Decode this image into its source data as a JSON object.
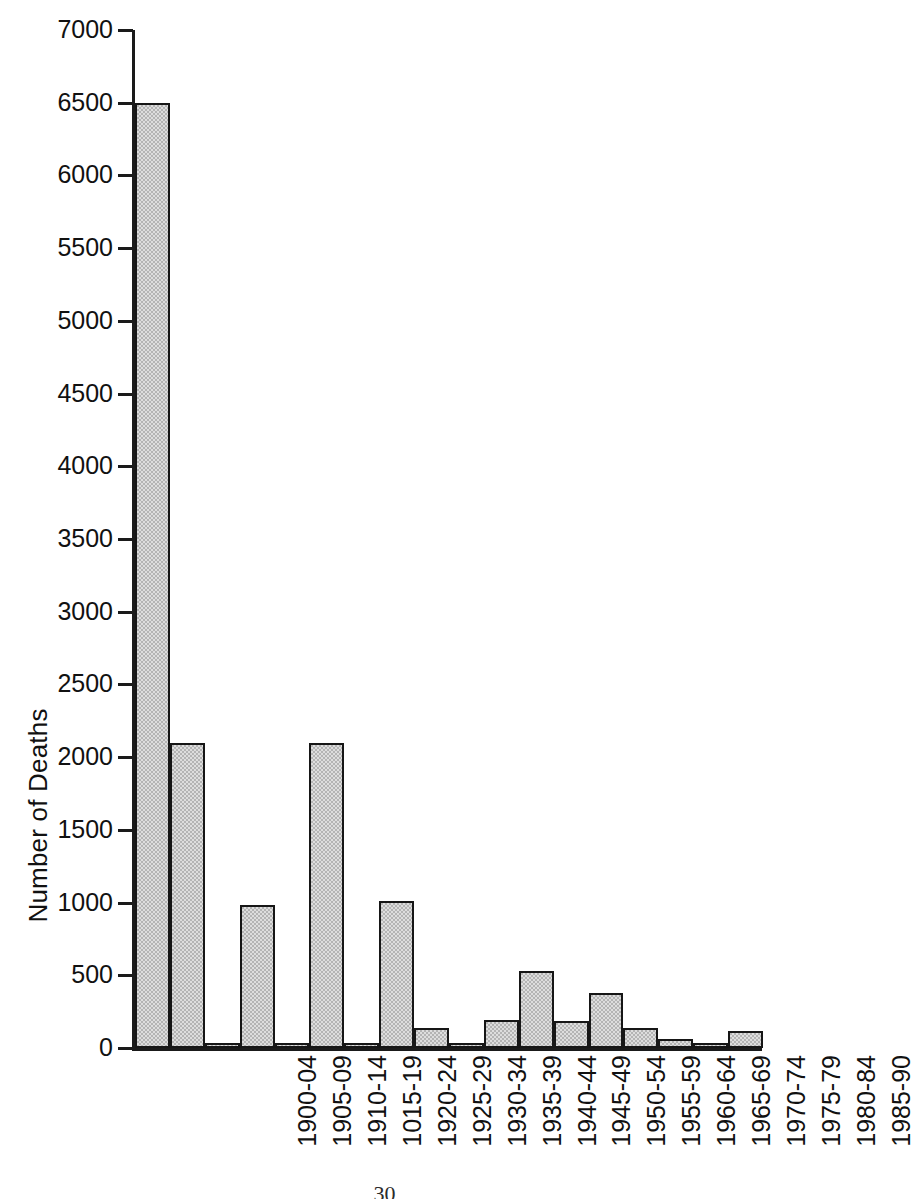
{
  "chart_data": {
    "type": "bar",
    "title": "",
    "xlabel": "",
    "ylabel": "Number of Deaths",
    "ylim": [
      0,
      7000
    ],
    "ytick_step": 500,
    "grid": false,
    "legend": null,
    "bar_color": "#b4b4b4",
    "bar_edge_color": "#161616",
    "categories": [
      "1900-04",
      "1905-09",
      "1910-14",
      "1015-19",
      "1920-24",
      "1925-29",
      "1930-34",
      "1935-39",
      "1940-44",
      "1945-49",
      "1950-54",
      "1955-59",
      "1960-64",
      "1965-69",
      "1970-74",
      "1975-79",
      "1980-84",
      "1985-90"
    ],
    "values": [
      6500,
      2100,
      30,
      985,
      25,
      2100,
      35,
      1010,
      140,
      35,
      190,
      530,
      185,
      375,
      140,
      60,
      30,
      115
    ],
    "yticks": [
      "0",
      "500",
      "1000",
      "1500",
      "2000",
      "2500",
      "3000",
      "3500",
      "4000",
      "4500",
      "5000",
      "5500",
      "6000",
      "6500",
      "7000"
    ],
    "ytick_values": [
      0,
      500,
      1000,
      1500,
      2000,
      2500,
      3000,
      3500,
      4000,
      4500,
      5000,
      5500,
      6000,
      6500,
      7000
    ]
  },
  "footer": {
    "page_number": "30"
  }
}
